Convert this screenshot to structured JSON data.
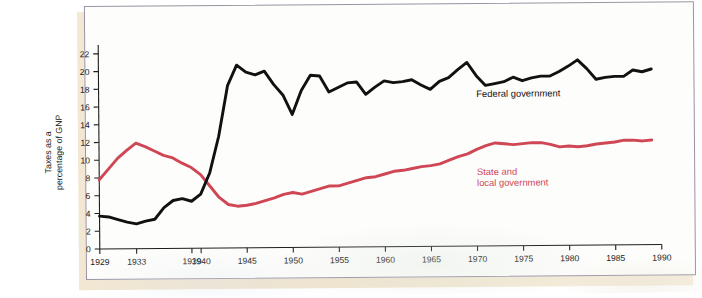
{
  "figure": {
    "frame_color": "#9b93a3",
    "paper_color": "#f1e5d0",
    "plot_background": "#fdfdfb"
  },
  "chart_data": {
    "type": "line",
    "title": "",
    "xlabel": "",
    "ylabel": "Taxes as a percentage of GNP",
    "ylabel_line1": "Taxes as a",
    "ylabel_line2": "percentage of GNP",
    "xlim": [
      1929,
      1990
    ],
    "ylim": [
      0,
      23
    ],
    "yticks": [
      0,
      2,
      4,
      6,
      8,
      10,
      12,
      14,
      16,
      18,
      20,
      22
    ],
    "ytick_labels": [
      "0",
      "2",
      "4",
      "6",
      "8",
      "10",
      "12",
      "14",
      "16",
      "18",
      "20",
      "22"
    ],
    "xticks": [
      1929,
      1933,
      1939,
      1940,
      1945,
      1950,
      1955,
      1960,
      1965,
      1970,
      1975,
      1980,
      1985,
      1990
    ],
    "xtick_labels": [
      "1929",
      "1933",
      "1939",
      "1940",
      "1945",
      "1950",
      "1955",
      "1960",
      "1965",
      "1970",
      "1975",
      "1980",
      "1985",
      "1990"
    ],
    "grid": false,
    "legend_position": "inline-annotation",
    "series": [
      {
        "name": "Federal government",
        "label": "Federal government",
        "color": "#111111",
        "annotation_x": 1970,
        "annotation_y": 16.8,
        "x": [
          1929,
          1930,
          1931,
          1932,
          1933,
          1934,
          1935,
          1936,
          1937,
          1938,
          1939,
          1940,
          1941,
          1942,
          1943,
          1944,
          1945,
          1946,
          1947,
          1948,
          1949,
          1950,
          1951,
          1952,
          1953,
          1954,
          1955,
          1956,
          1957,
          1958,
          1959,
          1960,
          1961,
          1962,
          1963,
          1964,
          1965,
          1966,
          1967,
          1968,
          1969,
          1970,
          1971,
          1972,
          1973,
          1974,
          1975,
          1976,
          1977,
          1978,
          1979,
          1980,
          1981,
          1982,
          1983,
          1984,
          1985,
          1986,
          1987,
          1988,
          1989
        ],
        "y": [
          3.7,
          3.6,
          3.3,
          3.0,
          2.8,
          3.1,
          3.3,
          4.6,
          5.4,
          5.6,
          5.3,
          6.1,
          8.5,
          12.6,
          18.3,
          20.6,
          19.8,
          19.5,
          19.9,
          18.4,
          17.2,
          15.0,
          17.7,
          19.4,
          19.3,
          17.5,
          18.0,
          18.5,
          18.6,
          17.2,
          18.0,
          18.7,
          18.5,
          18.6,
          18.8,
          18.2,
          17.7,
          18.6,
          19.0,
          19.9,
          20.7,
          19.2,
          18.1,
          18.3,
          18.5,
          19.0,
          18.6,
          18.9,
          19.1,
          19.1,
          19.6,
          20.2,
          20.9,
          19.9,
          18.7,
          18.9,
          19.0,
          19.0,
          19.7,
          19.5,
          19.8
        ]
      },
      {
        "name": "State and local government",
        "label_line1": "State and",
        "label_line2": "local government",
        "color": "#cf4655",
        "annotation_x": 1970,
        "annotation_y": 8.0,
        "x": [
          1929,
          1930,
          1931,
          1932,
          1933,
          1934,
          1935,
          1936,
          1937,
          1938,
          1939,
          1940,
          1941,
          1942,
          1943,
          1944,
          1945,
          1946,
          1947,
          1948,
          1949,
          1950,
          1951,
          1952,
          1953,
          1954,
          1955,
          1956,
          1957,
          1958,
          1959,
          1960,
          1961,
          1962,
          1963,
          1964,
          1965,
          1966,
          1967,
          1968,
          1969,
          1970,
          1971,
          1972,
          1973,
          1974,
          1975,
          1976,
          1977,
          1978,
          1979,
          1980,
          1981,
          1982,
          1983,
          1984,
          1985,
          1986,
          1987,
          1988,
          1989
        ],
        "y": [
          7.8,
          9.0,
          10.2,
          11.1,
          11.9,
          11.5,
          11.0,
          10.5,
          10.2,
          9.6,
          9.1,
          8.3,
          7.0,
          5.7,
          4.9,
          4.7,
          4.8,
          5.0,
          5.3,
          5.6,
          6.0,
          6.2,
          6.0,
          6.3,
          6.6,
          6.9,
          6.9,
          7.2,
          7.5,
          7.8,
          7.9,
          8.2,
          8.5,
          8.6,
          8.8,
          9.0,
          9.1,
          9.3,
          9.7,
          10.1,
          10.4,
          10.9,
          11.3,
          11.6,
          11.5,
          11.4,
          11.5,
          11.6,
          11.6,
          11.4,
          11.1,
          11.2,
          11.1,
          11.2,
          11.4,
          11.5,
          11.6,
          11.8,
          11.8,
          11.7,
          11.8
        ]
      }
    ]
  }
}
